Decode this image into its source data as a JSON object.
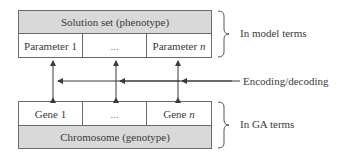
{
  "diagram": {
    "top_box": {
      "header": "Solution set (phenotype)",
      "cells": [
        "Parameter 1",
        "...",
        "Parameter "
      ],
      "cell_last_var": "n"
    },
    "bottom_box": {
      "cells": [
        "Gene 1",
        "...",
        "Gene "
      ],
      "cell_last_var": "n",
      "footer": "Chromosome (genotype)"
    },
    "labels": {
      "model_terms": "In model terms",
      "encoding": "Encoding/decoding",
      "ga_terms": "In GA terms"
    },
    "colors": {
      "header_fill": "#d9d9d9",
      "stroke": "#6a6a6a",
      "text": "#3a3a3a"
    }
  }
}
